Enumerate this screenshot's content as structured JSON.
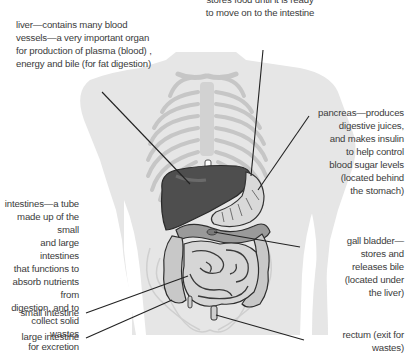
{
  "diagram": {
    "colors": {
      "body_silhouette": "#e6e6e6",
      "bones": "#c9c9c9",
      "organ_dark": "#4a4a4a",
      "organ_mid": "#8e8e8e",
      "organ_light": "#dcdcdc",
      "leader_line": "#222222",
      "text": "#3b3b3b"
    },
    "labels": {
      "stomach": {
        "line1": "stores food until it is ready",
        "line2": "to move on to the intestine"
      },
      "liver": {
        "line1": "liver—contains many blood",
        "line2": "vessels—a very important organ",
        "line3": "for production of plasma (blood) ,",
        "line4": "energy and bile (for fat digestion)"
      },
      "pancreas": {
        "line1": "pancreas—produces",
        "line2": "digestive juices,",
        "line3": "and makes insulin",
        "line4": "to help control",
        "line5": "blood sugar levels",
        "line6": "(located behind",
        "line7": "the stomach)"
      },
      "intestines": {
        "line1": "intestines—a tube",
        "line2": "made up of the small",
        "line3": "and large intestines",
        "line4": "that functions to",
        "line5": "absorb nutrients from",
        "line6": "digestion, and to",
        "line7": "collect solid wastes",
        "line8": "for excretion"
      },
      "gall_bladder": {
        "line1": "gall bladder—",
        "line2": "stores and",
        "line3": "releases bile",
        "line4": "(located under",
        "line5": "the liver)"
      },
      "small_intestine": {
        "line1": "small intestine"
      },
      "large_intestine": {
        "line1": "large intestine"
      },
      "rectum": {
        "line1": "rectum (exit for",
        "line2": "wastes)"
      }
    }
  }
}
